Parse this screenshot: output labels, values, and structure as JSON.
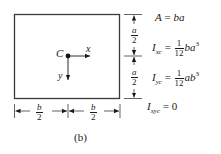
{
  "figure": {
    "caption": "(b)",
    "shape": "rectangle",
    "centroid_label": "C",
    "axis_x_label": "x",
    "axis_y_label": "y",
    "dimension_vertical": {
      "num": "a",
      "den": "2"
    },
    "dimension_horizontal": {
      "num": "b",
      "den": "2"
    }
  },
  "equations": [
    {
      "lhs": "A",
      "lhs_sub": "",
      "rhs": "ba"
    },
    {
      "lhs": "I",
      "lhs_sub": "xc",
      "coef_num": "1",
      "coef_den": "12",
      "rhs": "ba",
      "exp": "3"
    },
    {
      "lhs": "I",
      "lhs_sub": "yc",
      "coef_num": "1",
      "coef_den": "12",
      "rhs": "ab",
      "exp": "3"
    },
    {
      "lhs": "I",
      "lhs_sub": "xyc",
      "rhs": "0"
    }
  ],
  "colors": {
    "stroke": "#3a3a3a",
    "text": "#1a1a1a",
    "background": "#ffffff"
  }
}
